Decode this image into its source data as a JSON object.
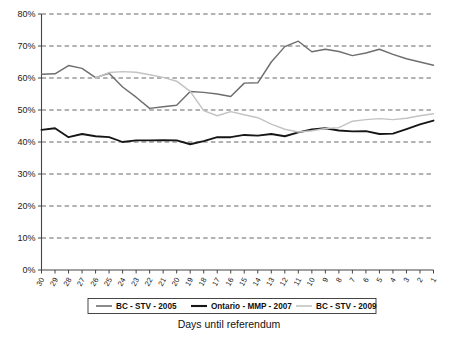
{
  "chart_data": {
    "type": "line",
    "title": "",
    "xlabel": "Days until referendum",
    "ylabel": "",
    "ylim": [
      0,
      80
    ],
    "ytick_labels": [
      "0%",
      "10%",
      "20%",
      "30%",
      "40%",
      "50%",
      "60%",
      "70%",
      "80%"
    ],
    "ytick_values": [
      0,
      10,
      20,
      30,
      40,
      50,
      60,
      70,
      80
    ],
    "grid": true,
    "grid_style": "dashed-horizontal",
    "legend_position": "bottom",
    "x_order": "descending",
    "categories": [
      30,
      29,
      28,
      27,
      26,
      25,
      24,
      23,
      22,
      21,
      20,
      19,
      18,
      17,
      16,
      15,
      14,
      13,
      12,
      11,
      10,
      9,
      8,
      7,
      6,
      5,
      4,
      3,
      2,
      1
    ],
    "series": [
      {
        "name": "BC - STV - 2005",
        "color": "#6e6e6e",
        "values": [
          61.2,
          61.3,
          63.9,
          63.0,
          60.1,
          61.5,
          57.2,
          54.0,
          50.5,
          51.0,
          51.5,
          55.8,
          55.5,
          55.0,
          54.2,
          58.4,
          58.5,
          65.0,
          69.8,
          71.5,
          68.2,
          69.0,
          68.3,
          67.0,
          67.8,
          69.0,
          67.4,
          66.0,
          65.0,
          64.0
        ]
      },
      {
        "name": "Ontario - MMP - 2007",
        "color": "#161616",
        "values": [
          43.8,
          44.3,
          41.5,
          42.5,
          41.8,
          41.5,
          40.0,
          40.5,
          40.5,
          40.6,
          40.5,
          39.3,
          40.3,
          41.5,
          41.5,
          42.2,
          42.0,
          42.5,
          41.8,
          43.0,
          43.9,
          44.3,
          43.6,
          43.3,
          43.4,
          42.5,
          42.6,
          44.0,
          45.5,
          46.7
        ]
      },
      {
        "name": "BC - STV - 2009",
        "color": "#c3c3c3",
        "values": [
          null,
          null,
          null,
          null,
          60.0,
          61.7,
          62.0,
          61.8,
          61.0,
          60.2,
          59.0,
          55.8,
          49.8,
          48.2,
          49.5,
          48.5,
          47.6,
          45.6,
          44.0,
          43.1,
          43.5,
          44.2,
          44.5,
          46.5,
          47.0,
          47.3,
          47.0,
          47.4,
          48.2,
          48.8
        ]
      }
    ]
  },
  "legend": {
    "items": [
      {
        "label": "BC - STV - 2005",
        "color": "#6e6e6e"
      },
      {
        "label": "Ontario - MMP - 2007",
        "color": "#161616"
      },
      {
        "label": "BC - STV - 2009",
        "color": "#c3c3c3"
      }
    ]
  },
  "axis": {
    "x_title": "Days until referendum"
  }
}
